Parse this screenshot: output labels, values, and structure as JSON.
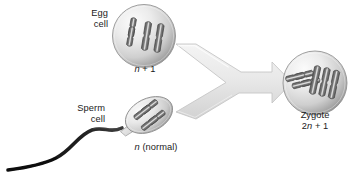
{
  "figure": {
    "background_color": "#ffffff",
    "text_color": "#1b1b1b"
  },
  "cells": {
    "egg": {
      "name_line_1": "Egg",
      "name_line_2": "cell",
      "ploidy_prefix": "",
      "ploidy_italic": "n",
      "ploidy_suffix": " + 1",
      "chromosome_count": 3,
      "shape": "circle",
      "fill_light": "#f2f2f2",
      "fill_dark": "#9a9a9a"
    },
    "sperm": {
      "name_line_1": "Sperm",
      "name_line_2": "cell",
      "ploidy_prefix": "",
      "ploidy_italic": "n",
      "ploidy_suffix": " (normal)",
      "chromosome_count": 2,
      "shape": "ellipse",
      "fill_light": "#f2f2f2",
      "fill_dark": "#9a9a9a",
      "tail_color": "#1a1a1a"
    },
    "zygote": {
      "name": "Zygote",
      "ploidy_prefix": "2",
      "ploidy_italic": "n",
      "ploidy_suffix": " + 1",
      "chromosome_count": 5,
      "shape": "circle",
      "fill_light": "#f2f2f2",
      "fill_dark": "#9a9a9a"
    }
  },
  "arrow": {
    "type": "merge-arrow",
    "direction": "right",
    "fill_light": "#f0f0f0",
    "fill_dark": "#cfcfcf",
    "stroke": "#c2c2c2"
  },
  "chromosome_style": {
    "outline": "#4a4a4a",
    "body_dark": "#6f6f6f",
    "body_light": "#d8d8d8"
  }
}
